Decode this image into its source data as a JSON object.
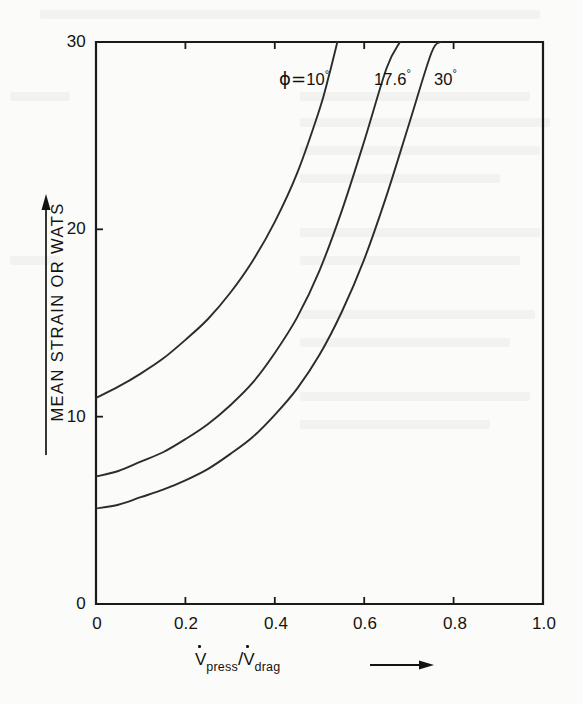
{
  "chart_data": {
    "type": "line",
    "title": "",
    "subtitle": "",
    "xlabel": "V̇press/V̇drag",
    "ylabel": "MEAN STRAIN OR WATS",
    "xlim": [
      0,
      1.0
    ],
    "ylim": [
      0,
      30
    ],
    "grid": false,
    "legend_position": "inline-curve-labels",
    "x_ticks": [
      "0",
      "0.2",
      "0.4",
      "0.6",
      "0.8",
      "1.0"
    ],
    "x_tick_values": [
      0,
      0.2,
      0.4,
      0.6,
      0.8,
      1.0
    ],
    "y_ticks": [
      "0",
      "10",
      "20",
      "30"
    ],
    "y_tick_values": [
      0,
      10,
      20,
      30
    ],
    "series": [
      {
        "name": "φ=10°",
        "label_text": "ϕ=10",
        "label_degree": "°",
        "x": [
          0.0,
          0.05,
          0.1,
          0.15,
          0.2,
          0.25,
          0.3,
          0.35,
          0.4,
          0.45,
          0.5,
          0.52,
          0.54
        ],
        "values": [
          11.0,
          11.6,
          12.3,
          13.1,
          14.1,
          15.2,
          16.6,
          18.3,
          20.4,
          23.0,
          26.4,
          28.1,
          30.0
        ]
      },
      {
        "name": "17.6°",
        "label_text": "17.6",
        "label_degree": "°",
        "x": [
          0.0,
          0.05,
          0.1,
          0.15,
          0.2,
          0.25,
          0.3,
          0.35,
          0.4,
          0.45,
          0.5,
          0.55,
          0.6,
          0.65,
          0.68
        ],
        "values": [
          6.8,
          7.1,
          7.6,
          8.1,
          8.8,
          9.6,
          10.6,
          11.8,
          13.4,
          15.3,
          17.8,
          21.0,
          24.7,
          28.6,
          30.0
        ]
      },
      {
        "name": "30°",
        "label_text": "30",
        "label_degree": "°",
        "x": [
          0.0,
          0.05,
          0.1,
          0.15,
          0.2,
          0.25,
          0.3,
          0.35,
          0.4,
          0.45,
          0.5,
          0.55,
          0.6,
          0.65,
          0.7,
          0.75,
          0.77
        ],
        "values": [
          5.1,
          5.3,
          5.7,
          6.1,
          6.6,
          7.2,
          8.0,
          8.9,
          10.1,
          11.5,
          13.3,
          15.6,
          18.4,
          21.8,
          25.6,
          29.4,
          30.0
        ]
      }
    ],
    "axis_color": "#1a1a1a",
    "curve_color": "#2c2c2c"
  },
  "axis": {
    "y_label": "MEAN STRAIN OR WATS",
    "x_label_numerator": "V",
    "x_label_numerator_sub": "press",
    "x_label_slash": "/",
    "x_label_denominator": "V",
    "x_label_denominator_sub": "drag",
    "y_tick_labels": [
      "30",
      "20",
      "10",
      "0"
    ],
    "x_tick_labels": [
      "0",
      "0.2",
      "0.4",
      "0.6",
      "0.8",
      "1.0"
    ]
  },
  "curve_labels": [
    {
      "id": "phi-10",
      "prefix": "ϕ=",
      "value": "10",
      "degree": "°"
    },
    {
      "id": "phi-17-6",
      "prefix": "",
      "value": "17.6",
      "degree": "°"
    },
    {
      "id": "phi-30",
      "prefix": "",
      "value": "30",
      "degree": "°"
    }
  ]
}
